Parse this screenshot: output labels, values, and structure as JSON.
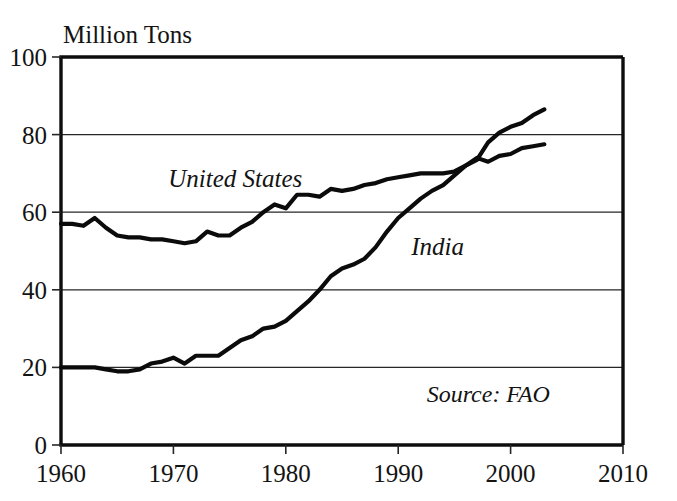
{
  "chart_data": {
    "type": "line",
    "title": "",
    "ylabel": "Million Tons",
    "xlabel": "",
    "xlim": [
      1960,
      2010
    ],
    "ylim": [
      0,
      100
    ],
    "grid": true,
    "legend_position": "inline-annotations",
    "xticks": [
      1960,
      1970,
      1980,
      1990,
      2000,
      2010
    ],
    "yticks": [
      0,
      20,
      40,
      60,
      80,
      100
    ],
    "xtick_labels": [
      "1960",
      "1970",
      "1980",
      "1990",
      "2000",
      "2010"
    ],
    "ytick_labels": [
      "0",
      "20",
      "40",
      "60",
      "80",
      "100"
    ],
    "annotations": [
      {
        "text": "United States",
        "x": 1975.5,
        "y": 66.5
      },
      {
        "text": "India",
        "x": 1993.5,
        "y": 49.0
      },
      {
        "text": "Source: FAO",
        "x": 2003.5,
        "y": 11.0
      }
    ],
    "series": [
      {
        "name": "United States",
        "x": [
          1960,
          1961,
          1962,
          1963,
          1964,
          1965,
          1966,
          1967,
          1968,
          1969,
          1970,
          1971,
          1972,
          1973,
          1974,
          1975,
          1976,
          1977,
          1978,
          1979,
          1980,
          1981,
          1982,
          1983,
          1984,
          1985,
          1986,
          1987,
          1988,
          1989,
          1990,
          1991,
          1992,
          1993,
          1994,
          1995,
          1996,
          1997,
          1998,
          1999,
          2000,
          2001,
          2002,
          2003
        ],
        "values": [
          57.0,
          57.0,
          56.5,
          58.5,
          56.0,
          54.0,
          53.5,
          53.5,
          53.0,
          53.0,
          52.5,
          52.0,
          52.5,
          55.0,
          54.0,
          54.0,
          56.0,
          57.5,
          60.0,
          62.0,
          61.0,
          64.5,
          64.5,
          64.0,
          66.0,
          65.5,
          66.0,
          67.0,
          67.5,
          68.5,
          69.0,
          69.5,
          70.0,
          70.0,
          70.0,
          70.5,
          72.0,
          74.0,
          73.0,
          74.5,
          75.0,
          76.5,
          77.0,
          77.5
        ]
      },
      {
        "name": "India",
        "x": [
          1960,
          1961,
          1962,
          1963,
          1964,
          1965,
          1966,
          1967,
          1968,
          1969,
          1970,
          1971,
          1972,
          1973,
          1974,
          1975,
          1976,
          1977,
          1978,
          1979,
          1980,
          1981,
          1982,
          1983,
          1984,
          1985,
          1986,
          1987,
          1988,
          1989,
          1990,
          1991,
          1992,
          1993,
          1994,
          1995,
          1996,
          1997,
          1998,
          1999,
          2000,
          2001,
          2002,
          2003
        ],
        "values": [
          20.0,
          20.0,
          20.0,
          20.0,
          19.5,
          19.0,
          19.0,
          19.5,
          21.0,
          21.5,
          22.5,
          21.0,
          23.0,
          23.0,
          23.0,
          25.0,
          27.0,
          28.0,
          30.0,
          30.5,
          32.0,
          34.5,
          37.0,
          40.0,
          43.5,
          45.5,
          46.5,
          48.0,
          51.0,
          55.0,
          58.5,
          61.0,
          63.5,
          65.5,
          67.0,
          69.5,
          72.0,
          73.5,
          78.0,
          80.5,
          82.0,
          83.0,
          85.0,
          86.5
        ]
      }
    ]
  },
  "axes": {
    "ylabel_text": "Million Tons"
  }
}
